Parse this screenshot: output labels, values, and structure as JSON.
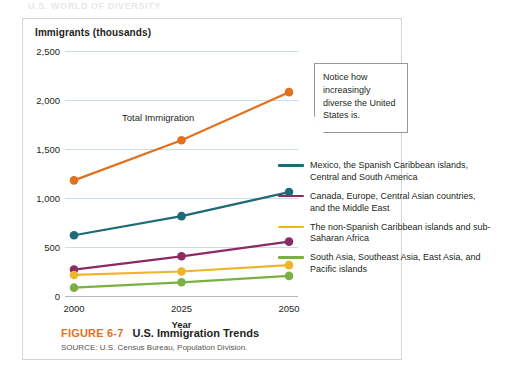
{
  "running_head": "U.S. WORLD OF DIVERSITY",
  "panel": {
    "y_axis_title": "Immigrants  (thousands)",
    "x_axis_label": "Year"
  },
  "callout": {
    "text": "Notice how increasingly diverse the United States is."
  },
  "annotation": {
    "total_immigration": "Total Immigration"
  },
  "caption": {
    "figure_number": "FIGURE 6-7",
    "title": "U.S. Immigration Trends",
    "source": "SOURCE: U.S. Census Bureau, Population Division."
  },
  "colors": {
    "orange": "#e2711d",
    "teal": "#1d6b77",
    "purple": "#8a2a66",
    "yellow": "#eeb528",
    "green": "#7bb143",
    "gridline": "#c9dde6",
    "figure_number": "#e2711d"
  },
  "legend": {
    "items": [
      {
        "label": "Mexico, the Spanish Caribbean islands, Central and South America",
        "color": "#1d6b77"
      },
      {
        "label": "Canada, Europe, Central Asian countries, and the Middle East",
        "color": "#8a2a66"
      },
      {
        "label": "The non-Spanish Caribbean islands and sub-Saharan Africa",
        "color": "#eeb528"
      },
      {
        "label": "South Asia, Southeast Asia, East Asia, and Pacific islands",
        "color": "#7bb143"
      }
    ]
  },
  "chart_data": {
    "type": "line",
    "title": "U.S. Immigration Trends",
    "xlabel": "Year",
    "ylabel": "Immigrants (thousands)",
    "x": [
      2000,
      2025,
      2050
    ],
    "xtick_labels": [
      "2000",
      "2025",
      "2050"
    ],
    "ytick_labels": [
      "0",
      "500",
      "1,000",
      "1,500",
      "2,000",
      "2,500"
    ],
    "yticks": [
      0,
      500,
      1000,
      1500,
      2000,
      2500
    ],
    "ylim": [
      0,
      2500
    ],
    "grid": true,
    "legend_position": "right",
    "series": [
      {
        "name": "Total Immigration",
        "color": "#e2711d",
        "values": [
          1180,
          1590,
          2080
        ],
        "in_legend": false,
        "annotated": true
      },
      {
        "name": "Mexico, the Spanish Caribbean islands, Central and South America",
        "color": "#1d6b77",
        "values": [
          620,
          815,
          1060
        ],
        "in_legend": true
      },
      {
        "name": "Canada, Europe, Central Asian countries, and the Middle East",
        "color": "#8a2a66",
        "values": [
          270,
          405,
          555
        ],
        "in_legend": true
      },
      {
        "name": "The non-Spanish Caribbean islands and sub-Saharan Africa",
        "color": "#eeb528",
        "values": [
          215,
          250,
          315
        ],
        "in_legend": true
      },
      {
        "name": "South Asia, Southeast Asia, East Asia, and Pacific islands",
        "color": "#7bb143",
        "values": [
          85,
          140,
          205
        ],
        "in_legend": true
      }
    ]
  }
}
